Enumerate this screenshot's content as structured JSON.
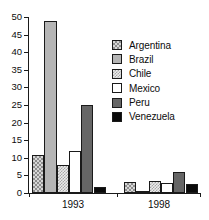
{
  "chart_data": {
    "type": "bar",
    "title": "",
    "subtitle": "",
    "xlabel": "",
    "ylabel": "",
    "categories": [
      "1993",
      "1998"
    ],
    "ylim": [
      0,
      50
    ],
    "yticks": [
      0,
      5,
      10,
      15,
      20,
      25,
      30,
      35,
      40,
      45,
      50
    ],
    "ytick_labels": [
      "0",
      "5",
      "10",
      "15",
      "20",
      "25",
      "30",
      "35",
      "40",
      "45",
      "50"
    ],
    "grid": false,
    "legend_position": "inside-top-right",
    "series": [
      {
        "name": "Argentina",
        "values": [
          10.7,
          3.0
        ],
        "swatch": "argentina",
        "color": "#d7d7d7"
      },
      {
        "name": "Brazil",
        "values": [
          49.0,
          0.6
        ],
        "swatch": "brazil",
        "color": "#b5b5b5"
      },
      {
        "name": "Chile",
        "values": [
          8.0,
          3.3
        ],
        "swatch": "chile",
        "color": "#ececec"
      },
      {
        "name": "Mexico",
        "values": [
          12.0,
          2.9
        ],
        "swatch": "mexico",
        "color": "#ffffff"
      },
      {
        "name": "Peru",
        "values": [
          25.0,
          6.1
        ],
        "swatch": "peru",
        "color": "#666666"
      },
      {
        "name": "Venezuela",
        "values": [
          1.7,
          2.5
        ],
        "swatch": "venezuela",
        "color": "#0a0a0a"
      }
    ]
  },
  "axis": {
    "line_color": "#1a1a1a"
  }
}
